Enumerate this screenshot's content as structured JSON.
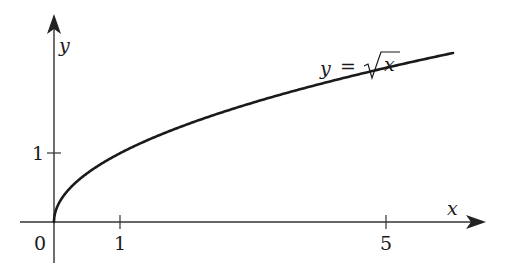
{
  "chart_data": {
    "type": "line",
    "title": "",
    "function": "y = sqrt(x)",
    "curve_label": {
      "lhs": "y",
      "eq": "=",
      "rhs": "x"
    },
    "xlabel": "x",
    "ylabel": "y",
    "origin_label": "0",
    "x_ticks": [
      {
        "value": 1,
        "label": "1"
      },
      {
        "value": 5,
        "label": "5"
      }
    ],
    "y_ticks": [
      {
        "value": 1,
        "label": "1"
      }
    ],
    "xlim": [
      -0.5,
      6.4
    ],
    "ylim": [
      -0.6,
      3.0
    ],
    "x": [
      0,
      0.25,
      0.5,
      1,
      2,
      3,
      4,
      5,
      6
    ],
    "values": [
      0,
      0.5,
      0.707,
      1,
      1.414,
      1.732,
      2,
      2.236,
      2.449
    ],
    "grid": false,
    "legend": "none",
    "colors": {
      "curve": "#1a1a1a",
      "axes": "#333333"
    }
  }
}
